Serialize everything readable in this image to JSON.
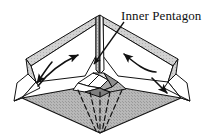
{
  "figure": {
    "title_label": "Inner Pentagon",
    "kind": "origami-fold-diagram",
    "colors": {
      "stroke": "#111111",
      "base_fill": "#b3b3b3",
      "wing_fill": "#c8c8c8",
      "facet_light": "#e2e2e2",
      "facet_mid": "#a8a8a8",
      "facet_dark": "#8d8d8d",
      "background": "#ffffff"
    },
    "annotations": [
      {
        "name": "inner-pentagon-callout",
        "text": "Inner Pentagon",
        "leader_from": [
          122,
          24
        ],
        "leader_to": [
          93,
          66
        ]
      }
    ],
    "motion_arrows": [
      {
        "name": "left-fold-arrow",
        "direction": "up-right"
      },
      {
        "name": "right-fold-arrow",
        "direction": "down-left"
      },
      {
        "name": "left-tip-arrow",
        "direction": "down-left"
      },
      {
        "name": "right-tip-arrow",
        "direction": "down-right"
      }
    ],
    "geometry": {
      "apex": [
        99,
        14
      ],
      "bottom_vertex": [
        100,
        133
      ],
      "left_tip": [
        14,
        101
      ],
      "right_tip": [
        190,
        101
      ],
      "base_left": [
        22,
        98
      ],
      "base_right": [
        181,
        98
      ]
    }
  }
}
